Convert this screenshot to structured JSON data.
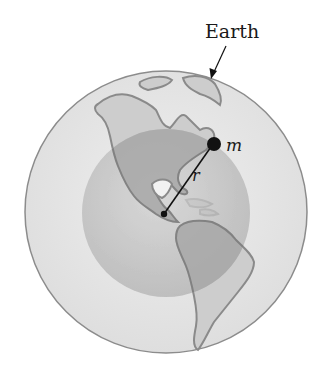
{
  "diagram": {
    "title_label": "Earth",
    "mass_label": "m",
    "radius_label": "r",
    "colors": {
      "outer_globe": "#e4e4e4",
      "outer_edge": "#8c8c8c",
      "inner_sphere": "#bdbdbd",
      "land": "#c8c8c8",
      "land_edge": "#8a8a8a",
      "ink": "#111111"
    }
  }
}
